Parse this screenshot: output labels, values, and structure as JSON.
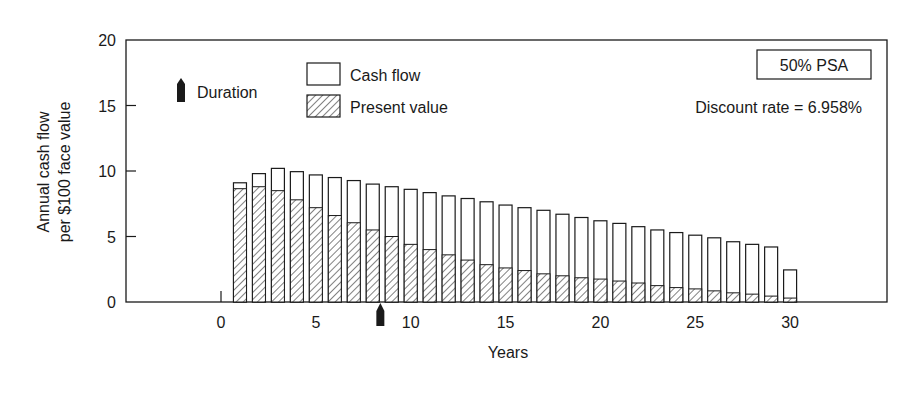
{
  "chart_data": {
    "type": "bar",
    "title": "",
    "xlabel": "Years",
    "ylabel_lines": [
      "Annual cash flow",
      "per $100 face value"
    ],
    "ylabel": "Annual cash flow per $100 face value",
    "xlim": [
      -5,
      35
    ],
    "ylim": [
      0,
      20
    ],
    "x_ticks": [
      0,
      5,
      10,
      15,
      20,
      25,
      30
    ],
    "y_ticks": [
      0,
      5,
      10,
      15,
      20
    ],
    "grid": false,
    "legend": {
      "position": "upper-center",
      "entries": [
        {
          "name": "Cash flow",
          "style": "open"
        },
        {
          "name": "Present value",
          "style": "hatched"
        }
      ]
    },
    "annotations": {
      "scenario_box": "50% PSA",
      "discount_rate_text": "Discount rate = 6.958%",
      "duration_legend_label": "Duration",
      "duration_value": 8.4
    },
    "categories": [
      1,
      2,
      3,
      4,
      5,
      6,
      7,
      8,
      9,
      10,
      11,
      12,
      13,
      14,
      15,
      16,
      17,
      18,
      19,
      20,
      21,
      22,
      23,
      24,
      25,
      26,
      27,
      28,
      29,
      30
    ],
    "series": [
      {
        "name": "Cash flow",
        "values": [
          9.1,
          9.8,
          10.2,
          9.95,
          9.7,
          9.5,
          9.27,
          9.0,
          8.8,
          8.6,
          8.35,
          8.1,
          7.9,
          7.65,
          7.4,
          7.2,
          7.0,
          6.7,
          6.45,
          6.2,
          6.0,
          5.75,
          5.5,
          5.3,
          5.1,
          4.9,
          4.6,
          4.4,
          4.2,
          2.45
        ]
      },
      {
        "name": "Present value",
        "values": [
          8.65,
          8.8,
          8.5,
          7.8,
          7.2,
          6.6,
          6.05,
          5.5,
          5.0,
          4.4,
          4.0,
          3.6,
          3.2,
          2.85,
          2.6,
          2.4,
          2.15,
          2.0,
          1.85,
          1.75,
          1.6,
          1.45,
          1.25,
          1.1,
          1.0,
          0.85,
          0.7,
          0.6,
          0.45,
          0.3
        ]
      }
    ]
  },
  "colors": {
    "ink": "#1a1a1a",
    "background": "#ffffff",
    "bar_fill": "#ffffff"
  }
}
